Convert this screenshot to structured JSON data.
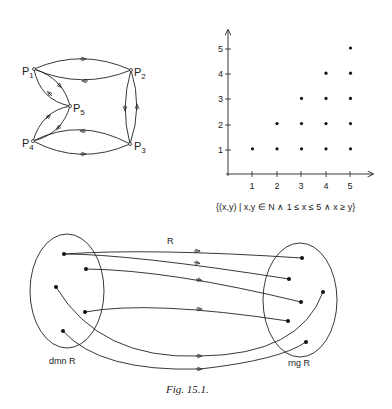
{
  "graph": {
    "nodes": [
      {
        "id": "P1",
        "label": "P",
        "sub": "1",
        "x": 34,
        "y": 69
      },
      {
        "id": "P2",
        "label": "P",
        "sub": "2",
        "x": 131,
        "y": 70
      },
      {
        "id": "P3",
        "label": "P",
        "sub": "3",
        "x": 130,
        "y": 144
      },
      {
        "id": "P4",
        "label": "P",
        "sub": "4",
        "x": 33,
        "y": 141
      },
      {
        "id": "P5",
        "label": "P",
        "sub": "5",
        "x": 70,
        "y": 106
      }
    ],
    "edges": [
      {
        "from": "P1",
        "to": "P2"
      },
      {
        "from": "P2",
        "to": "P1"
      },
      {
        "from": "P2",
        "to": "P3"
      },
      {
        "from": "P3",
        "to": "P2"
      },
      {
        "from": "P3",
        "to": "P4"
      },
      {
        "from": "P4",
        "to": "P3"
      },
      {
        "from": "P1",
        "to": "P5"
      },
      {
        "from": "P5",
        "to": "P1"
      },
      {
        "from": "P4",
        "to": "P5"
      },
      {
        "from": "P5",
        "to": "P4"
      }
    ]
  },
  "chart_data": {
    "type": "scatter",
    "title": "",
    "xlabel": "",
    "ylabel": "",
    "x_ticks": [
      "1",
      "2",
      "3",
      "4",
      "5"
    ],
    "y_ticks": [
      "1",
      "2",
      "3",
      "4",
      "5"
    ],
    "xlim": [
      0,
      5.5
    ],
    "ylim": [
      0,
      5.5
    ],
    "grid": false,
    "points": [
      [
        1,
        1
      ],
      [
        2,
        1
      ],
      [
        2,
        2
      ],
      [
        3,
        1
      ],
      [
        3,
        2
      ],
      [
        3,
        3
      ],
      [
        4,
        1
      ],
      [
        4,
        2
      ],
      [
        4,
        3
      ],
      [
        4,
        4
      ],
      [
        5,
        1
      ],
      [
        5,
        2
      ],
      [
        5,
        3
      ],
      [
        5,
        4
      ],
      [
        5,
        5
      ]
    ],
    "annotation": "{(x,y) | x,y ∈ N ∧ 1 ≤ x ≤ 5 ∧ x ≥ y}"
  },
  "relation": {
    "label": "R",
    "domain_label": "dmn R",
    "range_label": "rng R"
  },
  "caption": "Fig. 15.1."
}
